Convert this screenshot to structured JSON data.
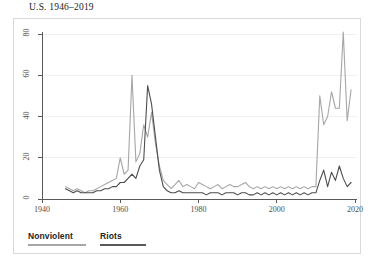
{
  "chart_data": {
    "type": "line",
    "title": "U.S. 1946–2019",
    "xlabel": "",
    "ylabel": "",
    "xlim": [
      1940,
      2020
    ],
    "ylim": [
      0,
      85
    ],
    "xticks": [
      1940,
      1960,
      1980,
      2000,
      2020
    ],
    "yticks": [
      0,
      20,
      40,
      60,
      80
    ],
    "grid": false,
    "legend_position": "bottom-left",
    "colors": {
      "nonviolent": "#a6a6a6",
      "riots": "#4d4d4d",
      "axis": "#595959",
      "frame": "#d9d9d9",
      "title_text": "#1a1a1a",
      "tick_text": "#4d4d4d"
    },
    "series": [
      {
        "name": "Nonviolent",
        "color": "#a6a6a6",
        "x": [
          1946,
          1947,
          1948,
          1949,
          1950,
          1951,
          1952,
          1953,
          1954,
          1955,
          1956,
          1957,
          1958,
          1959,
          1960,
          1961,
          1962,
          1963,
          1964,
          1965,
          1966,
          1967,
          1968,
          1969,
          1970,
          1971,
          1972,
          1973,
          1974,
          1975,
          1976,
          1977,
          1978,
          1979,
          1980,
          1981,
          1982,
          1983,
          1984,
          1985,
          1986,
          1987,
          1988,
          1989,
          1990,
          1991,
          1992,
          1993,
          1994,
          1995,
          1996,
          1997,
          1998,
          1999,
          2000,
          2001,
          2002,
          2003,
          2004,
          2005,
          2006,
          2007,
          2008,
          2009,
          2010,
          2011,
          2012,
          2013,
          2014,
          2015,
          2016,
          2017,
          2018,
          2019
        ],
        "values": [
          6,
          5,
          4,
          5,
          4,
          3,
          4,
          4,
          5,
          6,
          7,
          8,
          9,
          10,
          20,
          12,
          14,
          60,
          18,
          22,
          36,
          30,
          42,
          27,
          16,
          9,
          7,
          5,
          7,
          9,
          6,
          7,
          6,
          5,
          8,
          7,
          6,
          5,
          6,
          7,
          5,
          6,
          7,
          6,
          6,
          7,
          8,
          6,
          5,
          6,
          5,
          6,
          5,
          6,
          5,
          6,
          5,
          6,
          5,
          6,
          5,
          6,
          5,
          6,
          6,
          50,
          36,
          40,
          52,
          44,
          44,
          81,
          38,
          53
        ]
      },
      {
        "name": "Riots",
        "color": "#4d4d4d",
        "x": [
          1946,
          1947,
          1948,
          1949,
          1950,
          1951,
          1952,
          1953,
          1954,
          1955,
          1956,
          1957,
          1958,
          1959,
          1960,
          1961,
          1962,
          1963,
          1964,
          1965,
          1966,
          1967,
          1968,
          1969,
          1970,
          1971,
          1972,
          1973,
          1974,
          1975,
          1976,
          1977,
          1978,
          1979,
          1980,
          1981,
          1982,
          1983,
          1984,
          1985,
          1986,
          1987,
          1988,
          1989,
          1990,
          1991,
          1992,
          1993,
          1994,
          1995,
          1996,
          1997,
          1998,
          1999,
          2000,
          2001,
          2002,
          2003,
          2004,
          2005,
          2006,
          2007,
          2008,
          2009,
          2010,
          2011,
          2012,
          2013,
          2014,
          2015,
          2016,
          2017,
          2018,
          2019
        ],
        "values": [
          5,
          4,
          3,
          4,
          3,
          3,
          3,
          3,
          4,
          4,
          5,
          5,
          6,
          6,
          8,
          8,
          10,
          12,
          10,
          16,
          19,
          55,
          46,
          30,
          14,
          6,
          4,
          3,
          3,
          4,
          3,
          3,
          3,
          3,
          3,
          3,
          2,
          3,
          3,
          3,
          2,
          3,
          3,
          3,
          2,
          3,
          3,
          2,
          2,
          3,
          2,
          3,
          2,
          3,
          2,
          3,
          2,
          3,
          2,
          3,
          2,
          3,
          2,
          3,
          3,
          9,
          14,
          6,
          13,
          9,
          16,
          10,
          6,
          8
        ]
      }
    ]
  },
  "legend": {
    "items": [
      {
        "label": "Nonviolent",
        "color": "#a6a6a6"
      },
      {
        "label": "Riots",
        "color": "#595959"
      }
    ]
  },
  "axis": {
    "x_tick_labels": [
      "1940",
      "1960",
      "1980",
      "2000",
      "2020"
    ],
    "y_tick_labels": [
      "0",
      "20",
      "40",
      "60",
      "80"
    ]
  }
}
